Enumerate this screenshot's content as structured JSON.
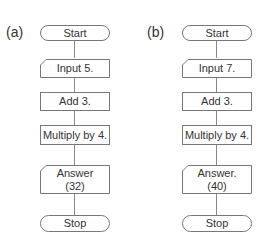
{
  "flowcharts": [
    {
      "label": "(a)",
      "steps": [
        {
          "type": "terminal",
          "text": "Start"
        },
        {
          "type": "input",
          "text": "Input 5."
        },
        {
          "type": "process",
          "text": "Add 3."
        },
        {
          "type": "process",
          "text": "Multiply by 4."
        },
        {
          "type": "output",
          "text": "Answer",
          "text2": "(32)"
        },
        {
          "type": "terminal",
          "text": "Stop"
        }
      ]
    },
    {
      "label": "(b)",
      "steps": [
        {
          "type": "terminal",
          "text": "Start"
        },
        {
          "type": "input",
          "text": "Input 7."
        },
        {
          "type": "process",
          "text": "Add 3."
        },
        {
          "type": "process",
          "text": "Multiply by 4."
        },
        {
          "type": "output",
          "text": "Answer.",
          "text2": "(40)"
        },
        {
          "type": "terminal",
          "text": "Stop"
        }
      ]
    }
  ],
  "colors": {
    "stroke": "#777777",
    "text": "#333333",
    "connector": "#888888"
  }
}
